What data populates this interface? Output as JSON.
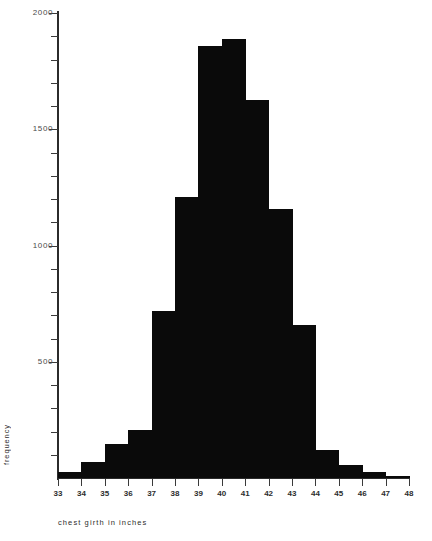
{
  "chart_data": {
    "type": "bar",
    "title": "",
    "subtitle": "",
    "xlabel": "chest girth in inches",
    "ylabel": "frequency",
    "grid": false,
    "legend": "none",
    "xlim": [
      33,
      48
    ],
    "ylim": [
      0,
      2000
    ],
    "x_tick_labels": [
      "33",
      "34",
      "35",
      "36",
      "37",
      "38",
      "39",
      "40",
      "41",
      "42",
      "43",
      "44",
      "45",
      "46",
      "47",
      "48"
    ],
    "y_tick_labels": [
      "2000",
      "1500",
      "1000",
      "500"
    ],
    "y_tick_values": [
      2000,
      1500,
      1000,
      500
    ],
    "y_minor_tick_step": 100,
    "bin_edges": [
      33,
      34,
      35,
      36,
      37,
      38,
      39,
      40,
      41,
      42,
      43,
      44,
      45,
      46,
      47,
      48
    ],
    "categories": [
      "33-34",
      "34-35",
      "35-36",
      "36-37",
      "37-38",
      "38-39",
      "39-40",
      "40-41",
      "41-42",
      "42-43",
      "43-44",
      "44-45",
      "45-46",
      "46-47",
      "47-48"
    ],
    "values": [
      25,
      70,
      148,
      205,
      717,
      1209,
      1857,
      1888,
      1627,
      1157,
      657,
      122,
      57,
      26,
      9
    ],
    "bar_color": "#0a0a0a",
    "axis_color": "#2b2b2b"
  }
}
